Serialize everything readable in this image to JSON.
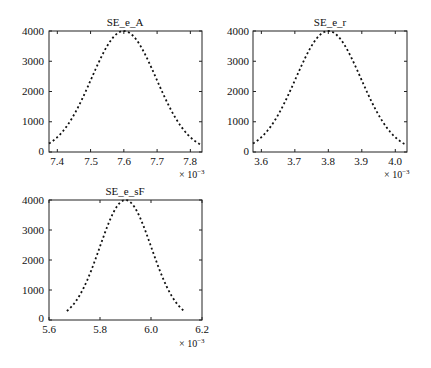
{
  "chart_data": [
    {
      "type": "line",
      "title": "SE_e_A",
      "xlabel": "",
      "ylabel": "",
      "x_multiplier": "× 10^-3",
      "xlim": [
        7.375,
        7.835
      ],
      "ylim": [
        0,
        4000
      ],
      "xticks": [
        "7.4",
        "7.5",
        "7.6",
        "7.7",
        "7.8"
      ],
      "yticks": [
        "0",
        "1000",
        "2000",
        "3000",
        "4000"
      ],
      "grid": false,
      "line_style": "dotted",
      "series": [
        {
          "name": "SE_e_A",
          "distribution": "gaussian",
          "mean": 7.6,
          "peak": 4000,
          "x": [
            7.375,
            7.4,
            7.45,
            7.5,
            7.55,
            7.6,
            7.65,
            7.7,
            7.75,
            7.8,
            7.83
          ],
          "values": [
            280,
            450,
            1000,
            2100,
            3450,
            4000,
            3450,
            2100,
            1000,
            450,
            280
          ]
        }
      ]
    },
    {
      "type": "line",
      "title": "SE_e_r",
      "xlabel": "",
      "ylabel": "",
      "x_multiplier": "× 10^-3",
      "xlim": [
        3.575,
        4.035
      ],
      "ylim": [
        0,
        4000
      ],
      "xticks": [
        "3.6",
        "3.7",
        "3.8",
        "3.9",
        "4.0"
      ],
      "yticks": [
        "0",
        "1000",
        "2000",
        "3000",
        "4000"
      ],
      "grid": false,
      "line_style": "dotted",
      "series": [
        {
          "name": "SE_e_r",
          "distribution": "gaussian",
          "mean": 3.8,
          "peak": 4000,
          "x": [
            3.575,
            3.6,
            3.65,
            3.7,
            3.75,
            3.8,
            3.85,
            3.9,
            3.95,
            4.0,
            4.03
          ],
          "values": [
            280,
            450,
            1000,
            2100,
            3450,
            4000,
            3450,
            2100,
            1000,
            450,
            280
          ]
        }
      ]
    },
    {
      "type": "line",
      "title": "SE_e_sF",
      "xlabel": "",
      "ylabel": "",
      "x_multiplier": "× 10^-3",
      "xlim": [
        5.6,
        6.2
      ],
      "ylim": [
        0,
        4000
      ],
      "xticks": [
        "5.6",
        "5.8",
        "6.0",
        "6.2"
      ],
      "yticks": [
        "0",
        "1000",
        "2000",
        "3000",
        "4000"
      ],
      "grid": false,
      "line_style": "dotted",
      "series": [
        {
          "name": "SE_e_sF",
          "distribution": "gaussian",
          "mean": 5.9,
          "peak": 4000,
          "x": [
            5.67,
            5.7,
            5.75,
            5.8,
            5.85,
            5.9,
            5.95,
            6.0,
            6.05,
            6.1,
            6.13
          ],
          "values": [
            300,
            500,
            1150,
            2300,
            3550,
            4000,
            3550,
            2300,
            1150,
            500,
            300
          ]
        }
      ]
    }
  ]
}
